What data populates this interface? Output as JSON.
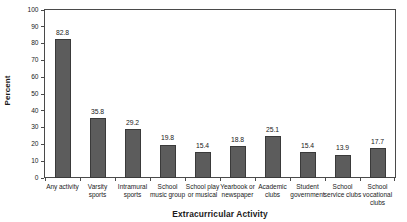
{
  "chart_data": {
    "type": "bar",
    "title": "",
    "xlabel": "Extracurricular Activity",
    "ylabel": "Percent",
    "ylim": [
      0,
      100
    ],
    "yticks": [
      0,
      10,
      20,
      30,
      40,
      50,
      60,
      70,
      80,
      90,
      100
    ],
    "grid": false,
    "legend": false,
    "bar_color": "#5c5c5c",
    "bar_edge_color": "#3a3a3a",
    "axis_color": "#4a4a4a",
    "categories": [
      "Any activity",
      "Varsity sports",
      "Intramural sports",
      "School music group",
      "School play or musical",
      "Yearbook or newspaper",
      "Academic clubs",
      "Student government",
      "School service clubs",
      "School vocational clubs"
    ],
    "category_label_lines": [
      [
        "Any activity"
      ],
      [
        "Varsity",
        "sports"
      ],
      [
        "Intramural",
        "sports"
      ],
      [
        "School",
        "music group"
      ],
      [
        "School play",
        "or musical"
      ],
      [
        "Yearbook or",
        "newspaper"
      ],
      [
        "Academic",
        "clubs"
      ],
      [
        "Student",
        "government"
      ],
      [
        "School",
        "service clubs"
      ],
      [
        "School",
        "vocational",
        "clubs"
      ]
    ],
    "values": [
      82.8,
      35.8,
      29.2,
      19.8,
      15.4,
      18.8,
      25.1,
      15.4,
      13.9,
      17.7
    ],
    "value_labels": [
      "82.8",
      "35.8",
      "29.2",
      "19.8",
      "15.4",
      "18.8",
      "25.1",
      "15.4",
      "13.9",
      "17.7"
    ]
  }
}
